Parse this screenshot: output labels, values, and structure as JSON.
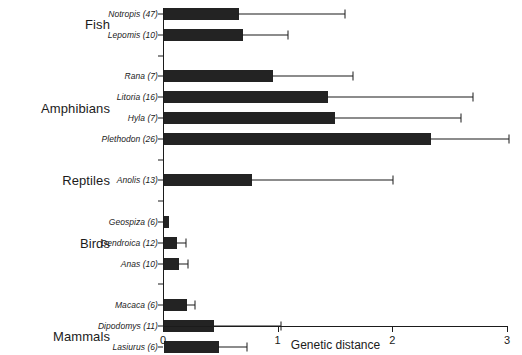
{
  "chart_data": {
    "type": "bar",
    "orientation": "horizontal",
    "title": "",
    "xlabel": "Genetic distance",
    "ylabel": "",
    "xlim": [
      0,
      3
    ],
    "xticks": [
      0,
      1,
      2,
      3
    ],
    "xticklabels": [
      "0",
      "1",
      "2",
      "3"
    ],
    "grid": false,
    "legend": null,
    "error_bars": "upper only",
    "groups": [
      {
        "name": "Fish",
        "categories": [
          {
            "label": "Notropis (47)",
            "genus": "Notropis",
            "n": 47,
            "value": 0.65,
            "error_upper": 1.59
          },
          {
            "label": "Lepomis (10)",
            "genus": "Lepomis",
            "n": 10,
            "value": 0.69,
            "error_upper": 1.09
          }
        ]
      },
      {
        "name": "Amphibians",
        "categories": [
          {
            "label": "Rana (7)",
            "genus": "Rana",
            "n": 7,
            "value": 0.95,
            "error_upper": 1.66
          },
          {
            "label": "Litoria (16)",
            "genus": "Litoria",
            "n": 16,
            "value": 1.43,
            "error_upper": 2.7
          },
          {
            "label": "Hyla (7)",
            "genus": "Hyla",
            "n": 7,
            "value": 1.49,
            "error_upper": 2.6
          },
          {
            "label": "Plethodon (26)",
            "genus": "Plethodon",
            "n": 26,
            "value": 2.33,
            "error_upper": 3.02
          }
        ]
      },
      {
        "name": "Reptiles",
        "categories": [
          {
            "label": "Anolis (13)",
            "genus": "Anolis",
            "n": 13,
            "value": 0.77,
            "error_upper": 2.01
          }
        ]
      },
      {
        "name": "Birds",
        "categories": [
          {
            "label": "Geospiza (6)",
            "genus": "Geospiza",
            "n": 6,
            "value": 0.04,
            "error_upper": 0.04
          },
          {
            "label": "Dendroica (12)",
            "genus": "Dendroica",
            "n": 12,
            "value": 0.11,
            "error_upper": 0.2
          },
          {
            "label": "Anas (10)",
            "genus": "Anas",
            "n": 10,
            "value": 0.13,
            "error_upper": 0.22
          }
        ]
      },
      {
        "name": "Mammals",
        "categories": [
          {
            "label": "Macaca (6)",
            "genus": "Macaca",
            "n": 6,
            "value": 0.2,
            "error_upper": 0.28
          },
          {
            "label": "Dipodomys (11)",
            "genus": "Dipodomys",
            "n": 11,
            "value": 0.44,
            "error_upper": 1.03
          },
          {
            "label": "Lasiurus (6)",
            "genus": "Lasiurus",
            "n": 6,
            "value": 0.48,
            "error_upper": 0.73
          },
          {
            "label": "Peromyscus (20)",
            "genus": "Peromyscus",
            "n": 20,
            "value": 0.53,
            "error_upper": 1.1
          }
        ]
      }
    ],
    "colors": {
      "bar": "#232323",
      "axis": "#1b1b1b",
      "background": "#ffffff"
    }
  }
}
